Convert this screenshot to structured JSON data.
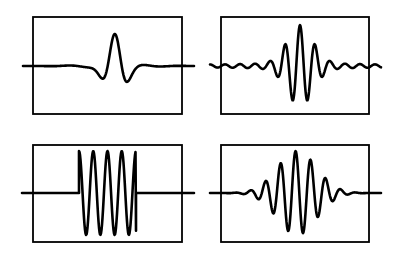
{
  "figure": {
    "stroke_color": "#000000",
    "background": "#ffffff",
    "panels": [
      {
        "id": "top-left",
        "label": "mexican-hat wavelet",
        "box": {
          "x": 33,
          "y": 17,
          "w": 149,
          "h": 97
        },
        "baseline_y": 66,
        "line_x": [
          23,
          194
        ],
        "waveform": "ricker",
        "center_x": 115,
        "amplitude": 32,
        "width": 7
      },
      {
        "id": "top-right",
        "label": "decaying sinc-like oscillation",
        "box": {
          "x": 221,
          "y": 17,
          "w": 148,
          "h": 97
        },
        "baseline_y": 66,
        "line_x": [
          210,
          381
        ],
        "waveform": "sinc",
        "center_x": 300,
        "amplitude": 40,
        "period": 15
      },
      {
        "id": "bottom-left",
        "label": "rectangular-windowed sinusoid",
        "box": {
          "x": 33,
          "y": 145,
          "w": 149,
          "h": 97
        },
        "baseline_y": 193,
        "line_x": [
          22,
          194
        ],
        "waveform": "rect",
        "start_x": 79,
        "end_x": 136,
        "amplitude": 42,
        "cycles": 4
      },
      {
        "id": "bottom-right",
        "label": "gaussian-windowed sinusoid",
        "box": {
          "x": 221,
          "y": 145,
          "w": 148,
          "h": 97
        },
        "baseline_y": 193,
        "line_x": [
          210,
          381
        ],
        "waveform": "gabor",
        "center_x": 297,
        "amplitude": 42,
        "period": 15,
        "sigma": 28
      }
    ]
  }
}
